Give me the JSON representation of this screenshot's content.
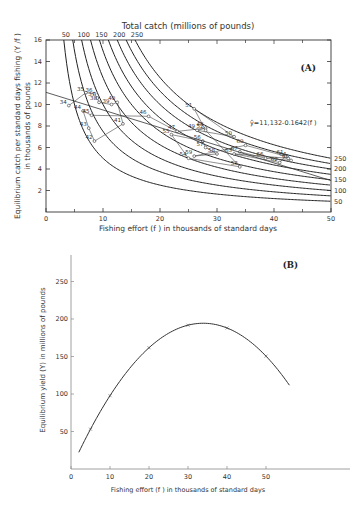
{
  "chart_data": [
    {
      "panel": "A",
      "type": "line",
      "title": "Total catch (millions of pounds)",
      "xlabel": "Fishing effort (f) in thousands of standard days",
      "ylabel": "Equilibrium catch per standard days fishing (Y/f) in thousands of pounds",
      "xlim": [
        0,
        50
      ],
      "ylim": [
        0,
        16
      ],
      "xticks": [
        "0",
        "10",
        "20",
        "30",
        "40",
        "50"
      ],
      "yticks": [
        "2",
        "4",
        "6",
        "8",
        "10",
        "12",
        "14",
        "16"
      ],
      "isopleth_labels": [
        "50",
        "100",
        "150",
        "200",
        "250"
      ],
      "isopleths": [
        {
          "total_catch": 50,
          "formula": "Y/f = 50/f"
        },
        {
          "total_catch": 75,
          "formula": "Y/f = 75/f"
        },
        {
          "total_catch": 100,
          "formula": "Y/f = 100/f"
        },
        {
          "total_catch": 125,
          "formula": "Y/f = 125/f"
        },
        {
          "total_catch": 150,
          "formula": "Y/f = 150/f"
        },
        {
          "total_catch": 175,
          "formula": "Y/f = 175/f"
        },
        {
          "total_catch": 200,
          "formula": "Y/f = 200/f"
        },
        {
          "total_catch": 225,
          "formula": "Y/f = 225/f"
        },
        {
          "total_catch": 250,
          "formula": "Y/f = 250/f"
        }
      ],
      "regression": {
        "label": "ŷ=11,132-0.1642(f)",
        "intercept": 11.132,
        "slope": -0.1642
      },
      "year_points": [
        {
          "year": "34",
          "x": 4.0,
          "y": 9.9
        },
        {
          "year": "35",
          "x": 7.0,
          "y": 11.1
        },
        {
          "year": "36",
          "x": 8.5,
          "y": 11.0
        },
        {
          "year": "37",
          "x": 9.0,
          "y": 10.6
        },
        {
          "year": "38",
          "x": 9.3,
          "y": 10.2
        },
        {
          "year": "39",
          "x": 11.5,
          "y": 10.0
        },
        {
          "year": "40",
          "x": 12.5,
          "y": 10.2
        },
        {
          "year": "41",
          "x": 13.5,
          "y": 8.2
        },
        {
          "year": "42",
          "x": 8.5,
          "y": 6.6
        },
        {
          "year": "43",
          "x": 7.5,
          "y": 7.8
        },
        {
          "year": "44",
          "x": 6.5,
          "y": 9.4
        },
        {
          "year": "45",
          "x": 8.0,
          "y": 9.0
        },
        {
          "year": "46",
          "x": 18.0,
          "y": 8.9
        },
        {
          "year": "47",
          "x": 23.0,
          "y": 7.5
        },
        {
          "year": "48",
          "x": 28.0,
          "y": 7.8
        },
        {
          "year": "49",
          "x": 26.5,
          "y": 7.6
        },
        {
          "year": "50",
          "x": 33.0,
          "y": 7.0
        },
        {
          "year": "51",
          "x": 26.0,
          "y": 9.6
        },
        {
          "year": "52",
          "x": 28.0,
          "y": 7.6
        },
        {
          "year": "53",
          "x": 34.0,
          "y": 4.2
        },
        {
          "year": "54",
          "x": 25.0,
          "y": 5.0
        },
        {
          "year": "55",
          "x": 22.0,
          "y": 7.2
        },
        {
          "year": "56",
          "x": 27.5,
          "y": 6.6
        },
        {
          "year": "57",
          "x": 28.0,
          "y": 6.0
        },
        {
          "year": "58",
          "x": 30.0,
          "y": 5.4
        },
        {
          "year": "59",
          "x": 26.0,
          "y": 5.2
        },
        {
          "year": "60",
          "x": 35.0,
          "y": 6.2
        },
        {
          "year": "61",
          "x": 42.0,
          "y": 5.2
        },
        {
          "year": "62",
          "x": 41.0,
          "y": 4.6
        },
        {
          "year": "63",
          "x": 33.0,
          "y": 5.4
        },
        {
          "year": "64",
          "x": 42.5,
          "y": 5.0
        },
        {
          "year": "65",
          "x": 43.0,
          "y": 4.8
        },
        {
          "year": "66",
          "x": 38.5,
          "y": 5.0
        },
        {
          "year": "67",
          "x": 34.0,
          "y": 5.6
        }
      ],
      "grid": false,
      "panel_label": "(A)"
    },
    {
      "panel": "B",
      "type": "line",
      "xlabel": "Fishing effort (f) in thousands of standard days",
      "ylabel": "Equilibrium yield (Y) in millions of pounds",
      "xlim": [
        0,
        60
      ],
      "ylim": [
        0,
        280
      ],
      "xticks": [
        "0",
        "10",
        "20",
        "30",
        "40",
        "50"
      ],
      "yticks": [
        "50",
        "100",
        "150",
        "200",
        "250"
      ],
      "x": [
        2,
        5,
        10,
        20,
        30,
        35,
        40,
        50,
        56
      ],
      "values": [
        22,
        50,
        90,
        155,
        189,
        193,
        188,
        160,
        125
      ],
      "markers_x": [
        5,
        10,
        20,
        30,
        40,
        50
      ],
      "markers_y": [
        50,
        90,
        155,
        189,
        188,
        160
      ],
      "formula": "Y = 11.132 f - 0.1642 f^2",
      "grid": false,
      "panel_label": "(B)"
    }
  ],
  "panelA": {
    "title": "Total catch (millions of pounds)",
    "label": "(A)",
    "ylabel1": "Equilibrium catch per standard days fishing (Y /f )",
    "ylabel2": "in thousands of pounds",
    "xlabel": "Fishing effort (f ) in thousands of standard days",
    "regression_label": "ŷ=11,132-0.1642(f )",
    "top_labels": [
      "50",
      "100",
      "150",
      "200",
      "250"
    ],
    "right_labels": [
      "250",
      "200",
      "150",
      "100",
      "50"
    ],
    "xticks": [
      "0",
      "10",
      "20",
      "30",
      "40",
      "50"
    ],
    "yticks": [
      "2",
      "4",
      "6",
      "8",
      "10",
      "12",
      "14",
      "16"
    ]
  },
  "panelB": {
    "label": "(B)",
    "ylabel": "Equilibrium yield (Y) in millions of pounds",
    "xlabel": "Fishing effort (f ) in thousands of standard days",
    "xticks": [
      "0",
      "10",
      "20",
      "30",
      "40",
      "50"
    ],
    "yticks": [
      "50",
      "100",
      "150",
      "200",
      "250"
    ]
  }
}
